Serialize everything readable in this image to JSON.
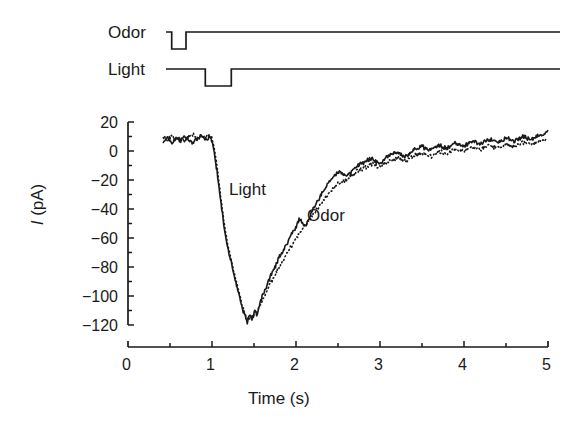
{
  "figure": {
    "background_color": "#ffffff",
    "ink_color": "#1a1a1a"
  },
  "stimulus": {
    "odor": {
      "label": "Odor",
      "pulse_start_s": 0.52,
      "pulse_end_s": 0.69
    },
    "light": {
      "label": "Light",
      "pulse_start_s": 0.92,
      "pulse_end_s": 1.23
    }
  },
  "trace_labels": {
    "light": "Light",
    "odor": "Odor"
  },
  "axes": {
    "y_title_italic": "I",
    "y_title_rest": " (pA)",
    "x_title": "Time (s)",
    "y_ticks": [
      "20",
      "0",
      "−20",
      "−40",
      "−60",
      "−80",
      "−100",
      "−120"
    ],
    "x_ticks": [
      "0",
      "1",
      "2",
      "3",
      "4",
      "5"
    ]
  },
  "chart_data": {
    "type": "line",
    "title": "",
    "xlabel": "Time (s)",
    "ylabel": "I (pA)",
    "xlim": [
      0,
      5
    ],
    "ylim": [
      -120,
      20
    ],
    "grid": false,
    "legend": "inline-annotations",
    "y_ticks": [
      20,
      0,
      -20,
      -40,
      -60,
      -80,
      -100,
      -120
    ],
    "x_ticks": [
      0,
      1,
      2,
      3,
      4,
      5
    ],
    "x_minor_tick_interval": 0.5,
    "annotations": [
      {
        "text": "Light",
        "x": 1.28,
        "y": -31
      },
      {
        "text": "Odor",
        "x": 2.21,
        "y": -49
      }
    ],
    "stimulus_traces": [
      {
        "name": "Odor",
        "type": "step-down-pulse",
        "start_s": 0.52,
        "end_s": 0.69
      },
      {
        "name": "Light",
        "type": "step-down-pulse",
        "start_s": 0.92,
        "end_s": 1.23
      }
    ],
    "series": [
      {
        "name": "Light",
        "style": "solid",
        "x": [
          0.42,
          0.47,
          0.52,
          0.57,
          0.62,
          0.67,
          0.72,
          0.77,
          0.82,
          0.87,
          0.92,
          0.97,
          1.0,
          1.03,
          1.06,
          1.09,
          1.12,
          1.15,
          1.18,
          1.21,
          1.24,
          1.27,
          1.3,
          1.33,
          1.36,
          1.39,
          1.42,
          1.45,
          1.48,
          1.51,
          1.54,
          1.57,
          1.6,
          1.65,
          1.7,
          1.75,
          1.8,
          1.85,
          1.9,
          1.95,
          2.0,
          2.05,
          2.1,
          2.15,
          2.2,
          2.25,
          2.3,
          2.35,
          2.4,
          2.45,
          2.5,
          2.6,
          2.7,
          2.8,
          2.9,
          3.0,
          3.1,
          3.2,
          3.3,
          3.4,
          3.5,
          3.6,
          3.7,
          3.8,
          3.9,
          4.0,
          4.1,
          4.2,
          4.3,
          4.4,
          4.5,
          4.6,
          4.7,
          4.8,
          4.9,
          5.0
        ],
        "y": [
          7,
          10,
          6,
          9,
          7,
          10,
          8,
          6,
          9,
          11,
          8,
          10,
          7,
          -2,
          -14,
          -28,
          -42,
          -55,
          -64,
          -72,
          -80,
          -87,
          -94,
          -101,
          -108,
          -113,
          -118,
          -113,
          -116,
          -110,
          -113,
          -105,
          -100,
          -93,
          -86,
          -80,
          -73,
          -68,
          -63,
          -57,
          -52,
          -46,
          -53,
          -47,
          -40,
          -35,
          -30,
          -25,
          -21,
          -17,
          -14,
          -18,
          -12,
          -8,
          -5,
          -9,
          -3,
          -1,
          -4,
          1,
          3,
          0,
          4,
          2,
          6,
          3,
          7,
          5,
          8,
          6,
          9,
          7,
          10,
          8,
          11,
          13
        ]
      },
      {
        "name": "Odor",
        "style": "dotted",
        "x": [
          0.42,
          0.47,
          0.52,
          0.57,
          0.62,
          0.67,
          0.72,
          0.77,
          0.82,
          0.87,
          0.92,
          0.97,
          1.0,
          1.03,
          1.06,
          1.09,
          1.12,
          1.15,
          1.18,
          1.21,
          1.24,
          1.27,
          1.3,
          1.33,
          1.36,
          1.39,
          1.42,
          1.45,
          1.48,
          1.51,
          1.54,
          1.57,
          1.6,
          1.65,
          1.7,
          1.75,
          1.8,
          1.85,
          1.9,
          1.95,
          2.0,
          2.05,
          2.1,
          2.15,
          2.2,
          2.25,
          2.3,
          2.35,
          2.4,
          2.45,
          2.5,
          2.6,
          2.7,
          2.8,
          2.9,
          3.0,
          3.1,
          3.2,
          3.3,
          3.4,
          3.5,
          3.6,
          3.7,
          3.8,
          3.9,
          4.0,
          4.1,
          4.2,
          4.3,
          4.4,
          4.5,
          4.6,
          4.7,
          4.8,
          4.9,
          5.0
        ],
        "y": [
          9,
          7,
          11,
          8,
          10,
          7,
          9,
          12,
          8,
          10,
          9,
          11,
          8,
          0,
          -11,
          -25,
          -39,
          -52,
          -62,
          -70,
          -79,
          -86,
          -93,
          -100,
          -107,
          -112,
          -116,
          -115,
          -114,
          -112,
          -110,
          -107,
          -103,
          -97,
          -91,
          -85,
          -80,
          -75,
          -70,
          -65,
          -60,
          -56,
          -52,
          -48,
          -44,
          -40,
          -36,
          -32,
          -29,
          -25,
          -22,
          -20,
          -15,
          -12,
          -9,
          -11,
          -7,
          -5,
          -7,
          -3,
          -1,
          -4,
          0,
          -2,
          2,
          0,
          3,
          1,
          4,
          2,
          5,
          3,
          6,
          4,
          7,
          8
        ]
      }
    ]
  }
}
